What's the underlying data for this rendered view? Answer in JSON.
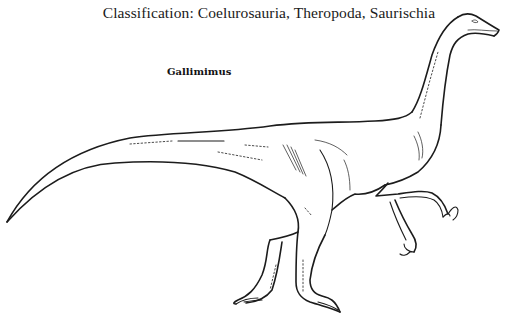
{
  "caption": {
    "classification": "Classification: Coelurosauria, Theropoda, Saurischia",
    "species_name": "Gallimimus"
  },
  "illustration": {
    "subject": "Gallimimus dinosaur line drawing",
    "style": "black ink outline on white",
    "colors": {
      "background": "#ffffff",
      "ink": "#1c1c1c"
    }
  }
}
